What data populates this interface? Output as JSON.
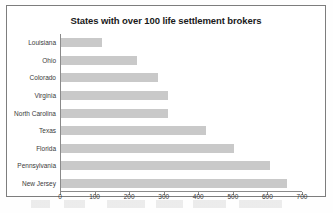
{
  "chart_data": {
    "type": "bar",
    "orientation": "horizontal",
    "title": "States with over 100 life settlement brokers",
    "xlabel": "",
    "ylabel": "",
    "categories": [
      "Louisiana",
      "Ohio",
      "Colorado",
      "Virginia",
      "North Carolina",
      "Texas",
      "Florida",
      "Pennsylvania",
      "New Jersey"
    ],
    "values": [
      120,
      220,
      280,
      310,
      310,
      420,
      500,
      605,
      655
    ],
    "xlim": [
      0,
      700
    ],
    "xticks": [
      0,
      100,
      200,
      300,
      400,
      500,
      600,
      700
    ],
    "xtick_labels": [
      "0",
      "100",
      "200",
      "300",
      "400",
      "500",
      "600",
      "700"
    ],
    "grid": false,
    "legend": null,
    "bar_color": "#c9c9c9",
    "axis_color": "#8a8a8a",
    "text_color": "#3a3a3a",
    "title_color": "#1a1a1a",
    "background": "#ffffff"
  }
}
